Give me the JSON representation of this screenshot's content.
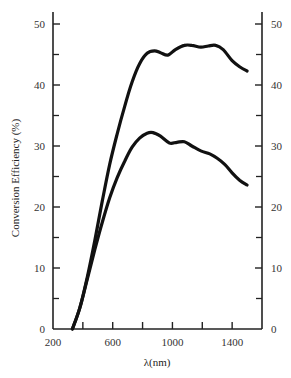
{
  "chart_data": {
    "type": "line",
    "title": "",
    "xlabel": "λ(nm)",
    "ylabel": "Conversion Efficiency (%)",
    "xlim": [
      200,
      1600
    ],
    "ylim": [
      0,
      52
    ],
    "x_ticks": [
      200,
      600,
      1000,
      1400
    ],
    "x_minor_ticks": [
      400,
      800,
      1200
    ],
    "y_ticks": [
      0,
      10,
      20,
      30,
      40,
      50
    ],
    "y_minor_ticks": [
      5,
      15,
      25,
      35,
      45
    ],
    "right_axis_ticks": [
      0,
      10,
      20,
      30,
      40,
      50
    ],
    "grid": false,
    "legend": null,
    "series": [
      {
        "name": "upper curve",
        "x": [
          330,
          380,
          430,
          480,
          530,
          580,
          630,
          680,
          730,
          780,
          830,
          880,
          920,
          970,
          1020,
          1080,
          1130,
          1190,
          1240,
          1290,
          1340,
          1400,
          1450,
          1500
        ],
        "values": [
          0,
          3.5,
          8.5,
          14.5,
          21,
          27,
          32,
          36.5,
          40.5,
          43.5,
          45.2,
          45.6,
          45.3,
          44.9,
          45.8,
          46.5,
          46.5,
          46.2,
          46.4,
          46.5,
          45.8,
          44.0,
          43.0,
          42.3
        ]
      },
      {
        "name": "lower curve",
        "x": [
          330,
          380,
          430,
          480,
          530,
          580,
          630,
          680,
          730,
          780,
          830,
          870,
          920,
          980,
          1030,
          1080,
          1130,
          1190,
          1250,
          1300,
          1350,
          1400,
          1450,
          1500
        ],
        "values": [
          0,
          3.5,
          8.2,
          13,
          17.5,
          21.5,
          24.8,
          27.5,
          29.8,
          31.3,
          32.1,
          32.2,
          31.6,
          30.5,
          30.6,
          30.7,
          30.0,
          29.2,
          28.7,
          28.0,
          27.0,
          25.6,
          24.4,
          23.6
        ]
      }
    ]
  }
}
